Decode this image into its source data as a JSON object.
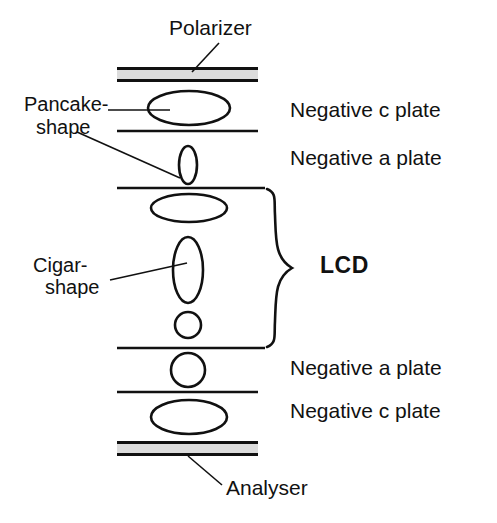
{
  "figure": {
    "type": "optical-stack-diagram",
    "background_color": "#ffffff",
    "stroke_color": "#111111",
    "polarizer_fill": "#dcdcdc"
  },
  "callouts": {
    "polarizer": "Polarizer",
    "analyser": "Analyser",
    "pancake_line1": "Pancake-",
    "pancake_line2": "shape",
    "cigar_line1": "Cigar-",
    "cigar_line2": "shape",
    "lcd": "LCD"
  },
  "layer_labels": [
    {
      "text": "Negative c plate",
      "x": 290,
      "y": 99
    },
    {
      "text": "Negative a plate",
      "x": 290,
      "y": 147
    },
    {
      "text": "Negative a plate",
      "x": 290,
      "y": 357
    },
    {
      "text": "Negative c plate",
      "x": 290,
      "y": 400
    }
  ],
  "stack": {
    "bars": [
      {
        "name": "polarizer-bar",
        "x": 117,
        "y": 67,
        "width": 141,
        "height": 15
      },
      {
        "name": "analyser-bar",
        "x": 117,
        "y": 441,
        "width": 141,
        "height": 15
      }
    ],
    "separators": [
      {
        "name": "separator-1",
        "x1": 117,
        "x2": 258,
        "y": 131
      },
      {
        "name": "separator-2",
        "x1": 117,
        "x2": 265,
        "y": 188
      },
      {
        "name": "separator-3",
        "x1": 117,
        "x2": 265,
        "y": 348
      },
      {
        "name": "separator-4",
        "x1": 117,
        "x2": 258,
        "y": 392
      }
    ],
    "molecules": [
      {
        "name": "pancake-ellipse-top",
        "cx": 189,
        "cy": 108,
        "rx": 41,
        "ry": 17
      },
      {
        "name": "narrow-ellipse-upper",
        "cx": 188,
        "cy": 165,
        "rx": 9,
        "ry": 19
      },
      {
        "name": "pancake-ellipse-lcd",
        "cx": 189,
        "cy": 208,
        "rx": 38,
        "ry": 14
      },
      {
        "name": "cigar-ellipse",
        "cx": 188,
        "cy": 270,
        "rx": 15,
        "ry": 33
      },
      {
        "name": "circle-lcd-bottom",
        "cx": 188,
        "cy": 325,
        "r": 13
      },
      {
        "name": "circle-a-plate",
        "cx": 188,
        "cy": 370,
        "r": 17
      },
      {
        "name": "pancake-ellipse-bottom",
        "cx": 189,
        "cy": 417,
        "rx": 38,
        "ry": 17
      }
    ],
    "brace": {
      "name": "lcd-brace",
      "x": 265,
      "y_top": 188,
      "y_bottom": 348,
      "tip_x": 293,
      "tip_y": 268
    },
    "leaders": [
      {
        "name": "polarizer-leader",
        "x1": 219,
        "y1": 43,
        "x2": 192,
        "y2": 72
      },
      {
        "name": "pancake-leader-top",
        "x1": 108,
        "y1": 110,
        "x2": 170,
        "y2": 110
      },
      {
        "name": "pancake-leader-lower",
        "x1": 77,
        "y1": 132,
        "x2": 180,
        "y2": 178
      },
      {
        "name": "cigar-leader",
        "x1": 110,
        "y1": 280,
        "x2": 187,
        "y2": 263
      },
      {
        "name": "analyser-leader",
        "x1": 188,
        "y1": 456,
        "x2": 222,
        "y2": 485
      }
    ]
  },
  "text_positions": {
    "polarizer": {
      "x": 169,
      "y": 17
    },
    "analyser": {
      "x": 226,
      "y": 477
    },
    "pancake_line1": {
      "x": 24,
      "y": 94
    },
    "pancake_line2": {
      "x": 36,
      "y": 117
    },
    "cigar_line1": {
      "x": 33,
      "y": 255
    },
    "cigar_line2": {
      "x": 45,
      "y": 277
    },
    "lcd": {
      "x": 320,
      "y": 254
    }
  }
}
